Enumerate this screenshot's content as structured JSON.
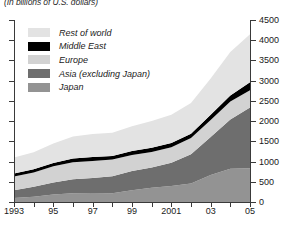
{
  "subtitle": "(In billions of U.S. dollars)",
  "legend": {
    "items": [
      {
        "label": "Rest of world",
        "color": "#e3e3e3"
      },
      {
        "label": "Middle East",
        "color": "#000000"
      },
      {
        "label": "Europe",
        "color": "#d2d2d2"
      },
      {
        "label": "Asia (excluding Japan)",
        "color": "#6e6e6e"
      },
      {
        "label": "Japan",
        "color": "#939393"
      }
    ]
  },
  "chart_data": {
    "type": "area",
    "stacked": true,
    "title": "",
    "subtitle": "(In billions of U.S. dollars)",
    "xlabel": "",
    "ylabel": "",
    "grid": false,
    "legend_position": "top-left",
    "xlim": [
      1993,
      2005
    ],
    "ylim": [
      0,
      4500
    ],
    "ytick_values": [
      0,
      500,
      1000,
      1500,
      2000,
      2500,
      3000,
      3500,
      4000,
      4500
    ],
    "ytick_labels": [
      "0",
      "500",
      "1000",
      "1500",
      "2000",
      "2500",
      "3000",
      "3500",
      "4000",
      "4500"
    ],
    "xtick_values": [
      1993,
      1995,
      1997,
      1999,
      2001,
      2003,
      2005
    ],
    "xtick_labels": [
      "1993",
      "95",
      "97",
      "99",
      "2001",
      "03",
      "05"
    ],
    "x": [
      1993,
      1994,
      1995,
      1996,
      1997,
      1998,
      1999,
      2000,
      2001,
      2002,
      2003,
      2004,
      2005
    ],
    "series": [
      {
        "name": "Japan",
        "color": "#939393",
        "values": [
          100,
          130,
          185,
          215,
          220,
          215,
          290,
          355,
          395,
          460,
          665,
          825,
          835
        ]
      },
      {
        "name": "Asia (excluding Japan)",
        "color": "#6e6e6e",
        "values": [
          190,
          245,
          300,
          350,
          375,
          420,
          475,
          500,
          575,
          720,
          940,
          1215,
          1500
        ]
      },
      {
        "name": "Europe",
        "color": "#d2d2d2",
        "values": [
          340,
          355,
          400,
          420,
          420,
          415,
          400,
          380,
          385,
          400,
          425,
          445,
          430
        ]
      },
      {
        "name": "Middle East",
        "color": "#000000",
        "values": [
          75,
          78,
          82,
          90,
          95,
          90,
          95,
          105,
          105,
          110,
          125,
          150,
          195
        ]
      },
      {
        "name": "Rest of world",
        "color": "#e3e3e3",
        "values": [
          395,
          420,
          480,
          545,
          570,
          575,
          615,
          665,
          700,
          760,
          900,
          1075,
          1190
        ]
      }
    ],
    "totals": [
      1100,
      1228,
      1447,
      1620,
      1680,
      1715,
      1875,
      2005,
      2160,
      2450,
      3055,
      3710,
      4150
    ]
  }
}
